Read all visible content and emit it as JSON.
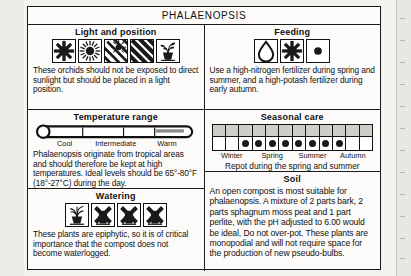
{
  "title": "PHALAENOPSIS",
  "sections": {
    "light": {
      "heading": "Light and position",
      "text": "These orchids should not be exposed to direct sunlight but should be placed in a light position.",
      "icons": [
        "sun-blocked-icon",
        "full-sun-icon",
        "sun-partial-shade-icon",
        "heavy-shade-icon",
        "potted-plant-icon"
      ]
    },
    "feeding": {
      "heading": "Feeding",
      "text": "Use a high-nitrogen fertilizer during spring and summer, and a high-potash fertilizer during early autumn.",
      "icons": [
        "water-drop-icon",
        "sun-blocked-icon",
        "dot-icon"
      ]
    },
    "temperature": {
      "heading": "Temperature range",
      "text": "Phalaenopsis originate from tropical areas and should therefore be kept at high temperatures. Ideal levels should be 65°-80°F (18°-27°C) during the day.",
      "scale_labels": [
        "Cool",
        "Intermediate",
        "Warm"
      ],
      "thermometer_icon": "thermometer-icon",
      "filled_range": "warm"
    },
    "seasonal": {
      "heading": "Seasonal care",
      "months": 12,
      "active_months": [
        3,
        4,
        5,
        6,
        7,
        8,
        9,
        10
      ],
      "season_labels": [
        "Winter",
        "Spring",
        "Summer",
        "Autumn"
      ],
      "note": "Repot during the spring and summer"
    },
    "watering": {
      "heading": "Watering",
      "text": "These plants are epiphytic, so it is of critical importance that the compost does not become waterlogged.",
      "icons": [
        "potted-plant-icon",
        "watering-blocked-icon",
        "watering-blocked-icon",
        "watering-blocked-icon"
      ]
    },
    "soil": {
      "heading": "Soil",
      "text": "An open compost is most suitable for phalaenopsis. A mixture of 2 parts bark, 2 parts sphagnum moss peat and 1 part perlite, with the pH adjusted to 6.00 would be ideal, Do not over-pot. These plants are monopodial and will not require space for the production of new pseudo-bulbs."
    }
  },
  "colors": {
    "paper": "#fcfbf9",
    "ink": "#1a1a1a",
    "grid_header": "#cfcdc8",
    "page_bg": "#f3f2ef"
  }
}
